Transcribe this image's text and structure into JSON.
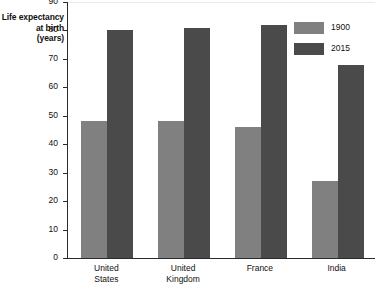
{
  "chart_data": {
    "type": "bar",
    "title": "",
    "subtitle": "",
    "xlabel": "",
    "ylabel": "Life expectancy at birth (years)",
    "ylabel_lines": [
      "Life expectancy",
      "at birth",
      "(years)"
    ],
    "categories": [
      "United States",
      "United Kingdom",
      "France",
      "India"
    ],
    "category_label_lines": [
      [
        "United",
        "States"
      ],
      [
        "United",
        "Kingdom"
      ],
      [
        "France"
      ],
      [
        "India"
      ]
    ],
    "series": [
      {
        "name": "1900",
        "color": "#808080",
        "values": [
          48,
          48,
          46,
          27
        ]
      },
      {
        "name": "2015",
        "color": "#4a4a4a",
        "values": [
          80,
          81,
          82,
          68
        ]
      }
    ],
    "ylim": [
      0,
      90
    ],
    "ytick_step": 10,
    "yticks": [
      0,
      10,
      20,
      30,
      40,
      50,
      60,
      70,
      80,
      90
    ],
    "ytick_labels": [
      "0",
      "10",
      "20",
      "30",
      "40",
      "50",
      "60",
      "70",
      "80",
      "90"
    ],
    "grid": false,
    "legend_position": "top-right",
    "legend_entries": [
      "1900",
      "2015"
    ]
  }
}
